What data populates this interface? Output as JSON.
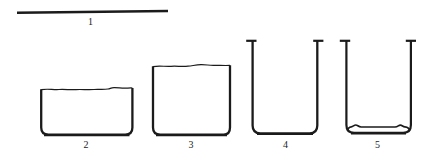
{
  "background_color": "#ffffff",
  "ink_color": "#1b1b1b",
  "items": [
    {
      "name": "glass-rod",
      "label": "1"
    },
    {
      "name": "wide-low-beaker",
      "label": "2"
    },
    {
      "name": "low-beaker",
      "label": "3"
    },
    {
      "name": "tall-beaker",
      "label": "4"
    },
    {
      "name": "tall-beaker-with-residue",
      "label": "5"
    }
  ]
}
